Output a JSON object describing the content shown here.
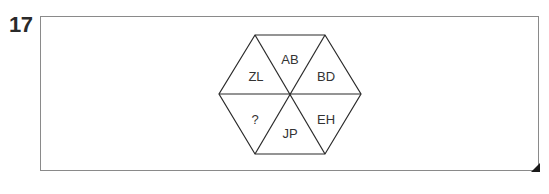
{
  "question": {
    "number": "17"
  },
  "hexagon": {
    "segments": [
      {
        "position": "top",
        "label": "AB"
      },
      {
        "position": "upper-right",
        "label": "BD"
      },
      {
        "position": "lower-right",
        "label": "EH"
      },
      {
        "position": "bottom",
        "label": "JP"
      },
      {
        "position": "lower-left",
        "label": "?"
      },
      {
        "position": "upper-left",
        "label": "ZL"
      }
    ]
  },
  "colors": {
    "line": "#2a2a2a",
    "box_border": "#8a8a8a",
    "text": "#333333"
  }
}
